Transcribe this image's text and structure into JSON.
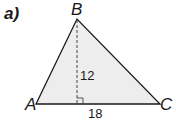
{
  "part_label": "a)",
  "vertices": {
    "A": "A",
    "B": "B",
    "C": "C"
  },
  "measurements": {
    "height": "12",
    "base": "18"
  },
  "colors": {
    "fill": "#ededed",
    "stroke": "#1a1a1a"
  }
}
